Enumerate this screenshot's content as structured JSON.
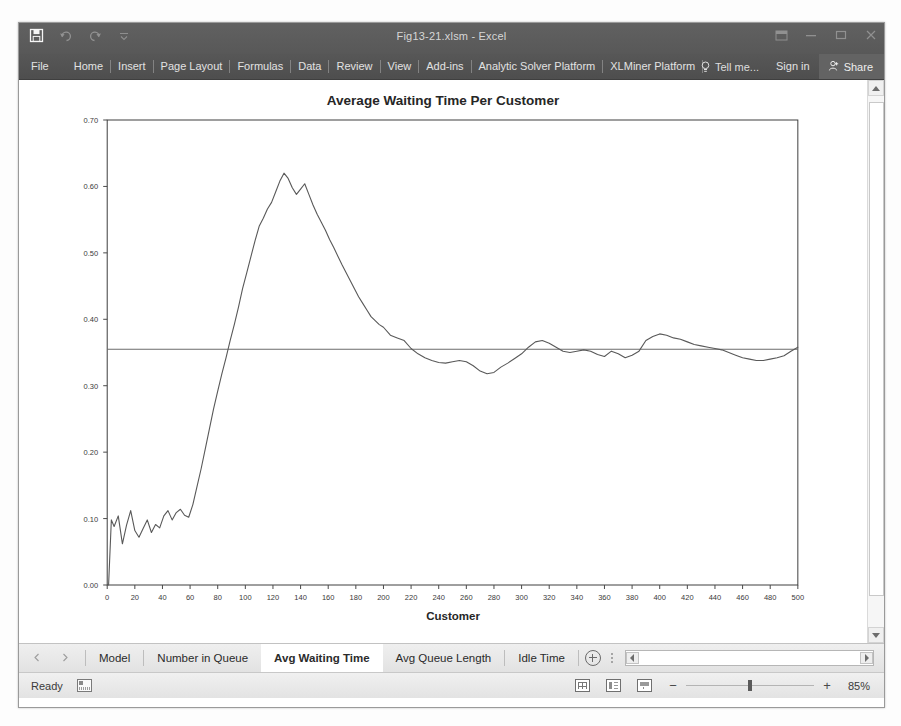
{
  "window": {
    "title": "Fig13-21.xlsm - Excel",
    "quick_access": [
      "save-icon",
      "undo-icon",
      "redo-icon",
      "customize-qat-icon"
    ],
    "controls": [
      "ribbon-display-options",
      "minimize",
      "restore",
      "close"
    ]
  },
  "ribbon": {
    "file_label": "File",
    "tabs": [
      "Home",
      "Insert",
      "Page Layout",
      "Formulas",
      "Data",
      "Review",
      "View",
      "Add-ins",
      "Analytic Solver Platform",
      "XLMiner Platform"
    ],
    "tell_me": "Tell me...",
    "sign_in": "Sign in",
    "share": "Share"
  },
  "sheet_tabs": {
    "items": [
      "Model",
      "Number in Queue",
      "Avg Waiting Time",
      "Avg Queue Length",
      "Idle Time"
    ],
    "active": "Avg Waiting Time",
    "add_sheet_label": "+"
  },
  "status_bar": {
    "mode": "Ready",
    "macro_record": "record-macro-icon",
    "views": [
      "normal-view",
      "page-layout-view",
      "page-break-preview"
    ],
    "zoom_out": "−",
    "zoom_in": "+",
    "zoom_level": "85%"
  },
  "chart_data": {
    "type": "line",
    "title": "Average Waiting Time Per Customer",
    "xlabel": "Customer",
    "ylabel": "",
    "xlim": [
      0,
      500
    ],
    "ylim": [
      0.0,
      0.7
    ],
    "xticks": [
      0,
      20,
      40,
      60,
      80,
      100,
      120,
      140,
      160,
      180,
      200,
      220,
      240,
      260,
      280,
      300,
      320,
      340,
      360,
      380,
      400,
      420,
      440,
      460,
      480,
      500
    ],
    "yticks": [
      "0.00",
      "0.10",
      "0.20",
      "0.30",
      "0.40",
      "0.50",
      "0.60",
      "0.70"
    ],
    "grid": false,
    "legend": false,
    "series": [
      {
        "name": "Average Waiting Time",
        "color": "#595959",
        "x": [
          1,
          3,
          5,
          8,
          11,
          14,
          17,
          20,
          23,
          26,
          29,
          32,
          35,
          38,
          41,
          44,
          47,
          50,
          53,
          56,
          59,
          62,
          65,
          68,
          71,
          74,
          77,
          80,
          83,
          86,
          89,
          92,
          95,
          98,
          101,
          104,
          107,
          110,
          113,
          116,
          119,
          122,
          125,
          128,
          131,
          134,
          137,
          140,
          143,
          146,
          149,
          152,
          155,
          158,
          161,
          164,
          167,
          170,
          173,
          176,
          179,
          182,
          185,
          188,
          191,
          194,
          197,
          200,
          205,
          210,
          215,
          220,
          225,
          230,
          235,
          240,
          245,
          250,
          255,
          260,
          265,
          270,
          275,
          280,
          285,
          290,
          295,
          300,
          305,
          310,
          315,
          320,
          325,
          330,
          335,
          340,
          345,
          350,
          355,
          360,
          365,
          370,
          375,
          380,
          385,
          390,
          395,
          400,
          405,
          410,
          415,
          420,
          425,
          430,
          435,
          440,
          445,
          450,
          455,
          460,
          465,
          470,
          475,
          480,
          485,
          490,
          495,
          500
        ],
        "y": [
          0.0,
          0.098,
          0.088,
          0.104,
          0.062,
          0.09,
          0.112,
          0.082,
          0.072,
          0.085,
          0.098,
          0.079,
          0.091,
          0.086,
          0.104,
          0.112,
          0.098,
          0.109,
          0.114,
          0.105,
          0.102,
          0.121,
          0.148,
          0.175,
          0.205,
          0.235,
          0.265,
          0.292,
          0.318,
          0.342,
          0.368,
          0.392,
          0.418,
          0.446,
          0.47,
          0.494,
          0.518,
          0.54,
          0.552,
          0.566,
          0.576,
          0.592,
          0.608,
          0.62,
          0.612,
          0.598,
          0.588,
          0.596,
          0.604,
          0.588,
          0.572,
          0.558,
          0.546,
          0.534,
          0.52,
          0.508,
          0.495,
          0.482,
          0.47,
          0.458,
          0.446,
          0.434,
          0.424,
          0.414,
          0.404,
          0.398,
          0.392,
          0.388,
          0.376,
          0.372,
          0.368,
          0.356,
          0.348,
          0.342,
          0.338,
          0.335,
          0.334,
          0.336,
          0.338,
          0.336,
          0.33,
          0.322,
          0.318,
          0.32,
          0.328,
          0.334,
          0.341,
          0.348,
          0.358,
          0.366,
          0.368,
          0.364,
          0.358,
          0.352,
          0.35,
          0.352,
          0.354,
          0.352,
          0.347,
          0.344,
          0.352,
          0.348,
          0.342,
          0.346,
          0.352,
          0.368,
          0.374,
          0.378,
          0.376,
          0.372,
          0.37,
          0.366,
          0.362,
          0.36,
          0.358,
          0.356,
          0.354,
          0.35,
          0.346,
          0.342,
          0.34,
          0.338,
          0.338,
          0.34,
          0.342,
          0.345,
          0.352,
          0.358
        ]
      },
      {
        "name": "Reference Line",
        "color": "#6b6b6b",
        "constant_y": 0.355
      }
    ]
  }
}
